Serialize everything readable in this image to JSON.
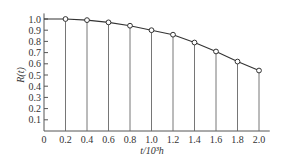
{
  "chart_data": {
    "type": "line",
    "title": "",
    "xlabel": "t/10³h",
    "ylabel": "R(t)",
    "x": [
      0.2,
      0.4,
      0.6,
      0.8,
      1.0,
      1.2,
      1.4,
      1.6,
      1.8,
      2.0
    ],
    "series": [
      {
        "name": "R(t)",
        "values": [
          1.0,
          0.99,
          0.97,
          0.94,
          0.9,
          0.86,
          0.79,
          0.71,
          0.62,
          0.54
        ]
      }
    ],
    "x_ticks": [
      "0",
      "0.2",
      "0.4",
      "0.6",
      "0.8",
      "1.0",
      "1.2",
      "1.4",
      "1.6",
      "1.8",
      "2.0"
    ],
    "y_ticks": [
      "0.1",
      "0.2",
      "0.3",
      "0.4",
      "0.5",
      "0.6",
      "0.7",
      "0.8",
      "0.9",
      "1.0"
    ],
    "xlim": [
      0,
      2.1
    ],
    "ylim": [
      0,
      1.05
    ],
    "grid": false,
    "drop_lines": true,
    "marker": "open-circle",
    "legend": null
  },
  "axes": {
    "x_title": "t/10³h",
    "y_title": "R(t)"
  }
}
